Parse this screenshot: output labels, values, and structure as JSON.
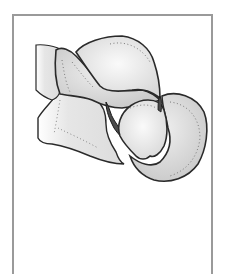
{
  "figure": {
    "colors": {
      "frame_border": "#9a9a9a",
      "outline": "#2a2a2a",
      "fill_light": "#ededed",
      "fill_mid": "#d8d8d8",
      "fill_dark": "#5a5a5a",
      "stipple": "#8a8a8a",
      "background": "#ffffff"
    }
  }
}
